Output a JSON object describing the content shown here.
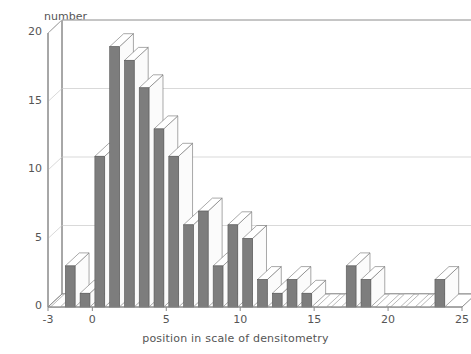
{
  "chart_data": {
    "type": "bar",
    "title": "",
    "subtitle": "",
    "xlabel": "position in scale of densitometry",
    "ylabel": "number",
    "grid": true,
    "legend": "none",
    "style": "3d-histogram",
    "xlim": [
      -3,
      25
    ],
    "ylim": [
      0,
      20
    ],
    "xticks": [
      "-3",
      "0",
      "5",
      "10",
      "15",
      "20",
      "25"
    ],
    "xtick_values": [
      -3,
      0,
      5,
      10,
      15,
      20,
      25
    ],
    "yticks": [
      "0",
      "5",
      "10",
      "15",
      "20"
    ],
    "ytick_values": [
      0,
      5,
      10,
      15,
      20
    ],
    "categories": [
      -3,
      -2,
      -1,
      0,
      1,
      2,
      3,
      4,
      5,
      6,
      7,
      8,
      9,
      10,
      11,
      12,
      13,
      14,
      15,
      16,
      17,
      18,
      19,
      20,
      21,
      22,
      23
    ],
    "values": [
      0,
      3,
      1,
      11,
      19,
      18,
      16,
      13,
      11,
      6,
      7,
      3,
      6,
      5,
      2,
      1,
      2,
      1,
      0,
      0,
      3,
      2,
      0,
      0,
      0,
      0,
      2
    ],
    "series": [
      {
        "name": "number",
        "values": [
          0,
          3,
          1,
          11,
          19,
          18,
          16,
          13,
          11,
          6,
          7,
          3,
          6,
          5,
          2,
          1,
          2,
          1,
          0,
          0,
          3,
          2,
          0,
          0,
          0,
          0,
          2
        ]
      }
    ],
    "bar_color": "#7d7d7d",
    "bar_top_color": "#ffffff",
    "grid_color": "#c9c9c9",
    "axis_color": "#8a8a8a",
    "text_color": "#555555"
  }
}
